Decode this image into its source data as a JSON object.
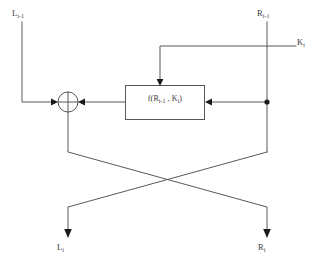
{
  "diagram": {
    "type": "block-flow-diagram",
    "colors": {
      "wire": "#58585a",
      "arrow": "#1a1a1a",
      "background": "#ffffff",
      "text": "#3a3a3c"
    },
    "labels": {
      "left_input": "L",
      "left_input_sub": "i-1",
      "right_input": "R",
      "right_input_sub": "i-1",
      "round_key": "K",
      "round_key_sub": "i",
      "left_output": "L",
      "left_output_sub": "i",
      "right_output": "R",
      "right_output_sub": "i"
    },
    "function_box": {
      "text_prefix": "f(R",
      "text_sub1": "i-1",
      "text_mid": " , K",
      "text_sub2": "i",
      "text_suffix": ")"
    },
    "nodes": [
      {
        "name": "xor-operator",
        "symbol": "crossed-circle",
        "cx": 68,
        "cy": 102,
        "r": 10
      },
      {
        "name": "right-branch-junction",
        "symbol": "filled-dot",
        "cx": 267,
        "cy": 102,
        "r": 2.6
      }
    ],
    "edges": [
      {
        "name": "left-input-wire",
        "from": "L_{i-1}",
        "to": "xor-operator"
      },
      {
        "name": "right-input-wire",
        "from": "R_{i-1}",
        "to": "right-branch-junction"
      },
      {
        "name": "round-key-wire",
        "from": "K_i",
        "to": "function-box"
      },
      {
        "name": "function-input-wire",
        "from": "right-branch-junction",
        "to": "function-box"
      },
      {
        "name": "function-output-wire",
        "from": "function-box",
        "to": "xor-operator"
      },
      {
        "name": "xor-to-right-output-wire",
        "from": "xor-operator",
        "to": "R_i"
      },
      {
        "name": "right-branch-to-left-output-wire",
        "from": "right-branch-junction",
        "to": "L_i"
      }
    ]
  }
}
